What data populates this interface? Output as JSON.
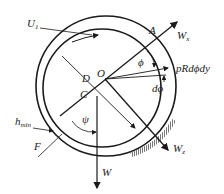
{
  "diagram": {
    "labels": {
      "U": "U",
      "U_sub": "1",
      "A": "A",
      "Wx": "W",
      "Wx_sub": "x",
      "phi": "ϕ",
      "force": "pRdϕdy",
      "dphi": "dϕ",
      "D": "D",
      "O": "O",
      "C": "C",
      "psi": "ψ",
      "h": "h",
      "h_sub": "min",
      "F": "F",
      "W": "W",
      "Wz": "W",
      "Wz_sub": "z"
    },
    "colors": {
      "stroke": "#1a1a1a",
      "hatch": "#777777"
    }
  }
}
